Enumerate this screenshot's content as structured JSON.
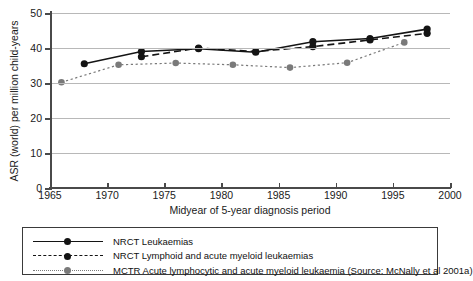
{
  "chart_data": {
    "type": "line",
    "title": "",
    "xlabel": "Midyear of 5-year diagnosis period",
    "ylabel": "ASR (world) per million child-years",
    "xlim": [
      1965,
      2000
    ],
    "ylim": [
      0,
      50
    ],
    "xticks": [
      1965,
      1970,
      1975,
      1980,
      1985,
      1990,
      1995,
      2000
    ],
    "yticks": [
      0,
      10,
      20,
      30,
      40,
      50
    ],
    "grid": "horizontal",
    "legend_position": "below-plot",
    "series": [
      {
        "name": "NRCT Leukaemias",
        "style": "solid",
        "color": "#141414",
        "marker": "circle",
        "x": [
          1968,
          1973,
          1978,
          1983,
          1988,
          1993,
          1998
        ],
        "y": [
          35.5,
          39.0,
          39.8,
          38.8,
          41.8,
          42.7,
          45.4
        ]
      },
      {
        "name": "NRCT Lymphoid and acute myeloid leukaemias",
        "style": "dashed",
        "color": "#141414",
        "marker": "circle",
        "x": [
          1973,
          1978,
          1983,
          1988,
          1993,
          1998
        ],
        "y": [
          37.5,
          40.0,
          39.0,
          40.4,
          42.3,
          44.2
        ]
      },
      {
        "name": "MCTR Acute lymphocytic and acute myeloid leukaemia (Source: McNally et al 2001a)",
        "style": "dotted",
        "color": "#7a7a7a",
        "marker": "circle",
        "x": [
          1966,
          1971,
          1976,
          1981,
          1986,
          1991,
          1996
        ],
        "y": [
          30.2,
          35.2,
          35.7,
          35.2,
          34.4,
          35.8,
          41.6
        ]
      }
    ]
  },
  "legend": {
    "items": [
      {
        "label": "NRCT Leukaemias"
      },
      {
        "label": "NRCT Lymphoid and acute myeloid leukaemias"
      },
      {
        "label": "MCTR Acute lymphocytic and acute myeloid leukaemia (Source: McNally et al 2001a)"
      }
    ]
  }
}
